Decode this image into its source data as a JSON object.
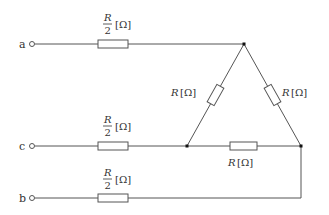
{
  "diagram": {
    "type": "circuit",
    "colors": {
      "wire": "#555555",
      "text": "#333333",
      "node": "#111111"
    },
    "terminals": [
      {
        "id": "a",
        "label": "a"
      },
      {
        "id": "c",
        "label": "c"
      },
      {
        "id": "b",
        "label": "b"
      }
    ],
    "line_resistors": [
      {
        "line": "a",
        "numerator": "R",
        "denominator": "2",
        "unit": "[Ω]"
      },
      {
        "line": "c",
        "numerator": "R",
        "denominator": "2",
        "unit": "[Ω]"
      },
      {
        "line": "b",
        "numerator": "R",
        "denominator": "2",
        "unit": "[Ω]"
      }
    ],
    "delta_resistors": [
      {
        "position": "left-side",
        "symbol": "R",
        "unit": "[Ω]"
      },
      {
        "position": "right-side",
        "symbol": "R",
        "unit": "[Ω]"
      },
      {
        "position": "bottom",
        "symbol": "R",
        "unit": "[Ω]"
      }
    ]
  }
}
